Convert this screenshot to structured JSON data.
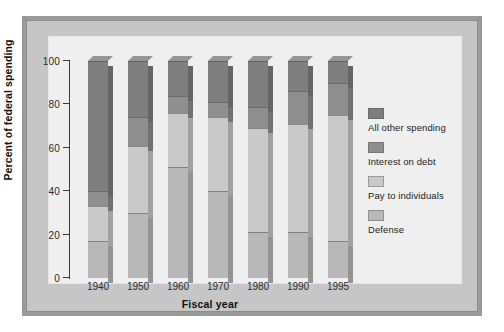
{
  "chart_data": {
    "type": "bar",
    "subtype": "stacked-100-percent",
    "title": "",
    "xlabel": "Fiscal year",
    "ylabel": "Percent of federal spending",
    "categories": [
      "1940",
      "1950",
      "1960",
      "1970",
      "1980",
      "1990",
      "1995"
    ],
    "ylim": [
      0,
      100
    ],
    "yticks": [
      0,
      20,
      40,
      60,
      80,
      100
    ],
    "ytick_labels": [
      "0",
      "20",
      "40",
      "60",
      "80",
      "100"
    ],
    "grid": false,
    "legend_position": "right",
    "stack_order_bottom_to_top": [
      "Defense",
      "Pay to individuals",
      "Interest on debt",
      "All other spending"
    ],
    "series": [
      {
        "name": "Defense",
        "color": "#b8b8b8",
        "values": [
          17,
          30,
          51,
          40,
          21,
          21,
          17
        ]
      },
      {
        "name": "Pay to individuals",
        "color": "#c9c9c9",
        "values": [
          16,
          31,
          25,
          34,
          48,
          50,
          58
        ]
      },
      {
        "name": "Interest on debt",
        "color": "#8f8f8f",
        "values": [
          7,
          13,
          8,
          7,
          10,
          15,
          15
        ]
      },
      {
        "name": "All other spending",
        "color": "#7e7e7e",
        "values": [
          60,
          26,
          16,
          19,
          21,
          14,
          10
        ]
      }
    ],
    "cumulative_tops": {
      "1940": [
        17,
        33,
        40,
        100
      ],
      "1950": [
        30,
        61,
        74,
        100
      ],
      "1960": [
        51,
        76,
        84,
        100
      ],
      "1970": [
        40,
        74,
        81,
        100
      ],
      "1980": [
        21,
        69,
        79,
        100
      ],
      "1990": [
        21,
        71,
        86,
        100
      ],
      "1995": [
        17,
        75,
        90,
        100
      ]
    }
  },
  "legend": {
    "items": [
      {
        "label": "All other spending",
        "color": "#7e7e7e"
      },
      {
        "label": "Interest on debt",
        "color": "#8f8f8f"
      },
      {
        "label": "Pay to individuals",
        "color": "#c9c9c9"
      },
      {
        "label": "Defense",
        "color": "#b8b8b8"
      }
    ]
  },
  "axes": {
    "y_title": "Percent of federal spending",
    "x_title": "Fiscal year",
    "y_tick_labels": [
      "100",
      "80",
      "60",
      "40",
      "20",
      "0"
    ],
    "x_tick_labels": [
      "1940",
      "1950",
      "1960",
      "1970",
      "1980",
      "1990",
      "1995"
    ]
  },
  "style": {
    "panel_bg": "#c6c6c6",
    "plot_bg": "#efefef",
    "outer_border": "#9a9a9a",
    "axis_color": "#3a3a3a"
  }
}
